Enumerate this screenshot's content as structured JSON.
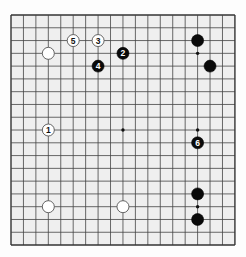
{
  "board": {
    "size": 19,
    "origin_x": 11,
    "origin_y": 15,
    "pitch_x": 12.44,
    "pitch_y": 12.78,
    "board_color": "#efefef",
    "line_color": "#444444",
    "edge_color": "#333333"
  },
  "star_points": [
    [
      3,
      3
    ],
    [
      9,
      3
    ],
    [
      15,
      3
    ],
    [
      3,
      9
    ],
    [
      9,
      9
    ],
    [
      15,
      9
    ],
    [
      3,
      15
    ],
    [
      9,
      15
    ],
    [
      15,
      15
    ]
  ],
  "stones": [
    {
      "color": "white",
      "col": 3,
      "row": 3,
      "label": ""
    },
    {
      "color": "black",
      "col": 15,
      "row": 2,
      "label": ""
    },
    {
      "color": "black",
      "col": 16,
      "row": 4,
      "label": ""
    },
    {
      "color": "white",
      "col": 3,
      "row": 15,
      "label": ""
    },
    {
      "color": "white",
      "col": 9,
      "row": 15,
      "label": ""
    },
    {
      "color": "black",
      "col": 15,
      "row": 14,
      "label": ""
    },
    {
      "color": "black",
      "col": 15,
      "row": 16,
      "label": ""
    },
    {
      "color": "white",
      "col": 3,
      "row": 9,
      "label": "1"
    },
    {
      "color": "black",
      "col": 9,
      "row": 3,
      "label": "2"
    },
    {
      "color": "white",
      "col": 7,
      "row": 2,
      "label": "3"
    },
    {
      "color": "black",
      "col": 7,
      "row": 4,
      "label": "4"
    },
    {
      "color": "white",
      "col": 5,
      "row": 2,
      "label": "5"
    },
    {
      "color": "black",
      "col": 15,
      "row": 10,
      "label": "6"
    }
  ]
}
